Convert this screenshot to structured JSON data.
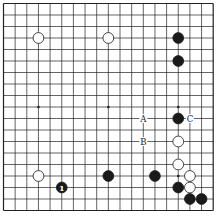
{
  "board": {
    "size": 19,
    "origin_x": 3.5,
    "origin_y": 3.5,
    "step_x": 11.65,
    "step_y": 11.5,
    "line_color": "#222222",
    "star_points": [
      [
        3,
        3
      ],
      [
        9,
        3
      ],
      [
        15,
        3
      ],
      [
        3,
        9
      ],
      [
        9,
        9
      ],
      [
        15,
        9
      ],
      [
        3,
        15
      ],
      [
        9,
        15
      ],
      [
        15,
        15
      ]
    ]
  },
  "stones": [
    {
      "color": "white",
      "col": 3,
      "row": 3
    },
    {
      "color": "white",
      "col": 9,
      "row": 3
    },
    {
      "color": "black",
      "col": 15,
      "row": 3
    },
    {
      "color": "black",
      "col": 15,
      "row": 5
    },
    {
      "color": "black",
      "col": 15,
      "row": 10
    },
    {
      "color": "white",
      "col": 15,
      "row": 12
    },
    {
      "color": "white",
      "col": 15,
      "row": 14
    },
    {
      "color": "white",
      "col": 3,
      "row": 15
    },
    {
      "color": "black",
      "col": 9,
      "row": 15
    },
    {
      "color": "black",
      "col": 13,
      "row": 15
    },
    {
      "color": "white",
      "col": 16,
      "row": 15
    },
    {
      "color": "black",
      "col": 5,
      "row": 16,
      "label": "1"
    },
    {
      "color": "black",
      "col": 15,
      "row": 16
    },
    {
      "color": "white",
      "col": 16,
      "row": 16
    },
    {
      "color": "black",
      "col": 16,
      "row": 17
    },
    {
      "color": "black",
      "col": 17,
      "row": 17
    }
  ],
  "markers": [
    {
      "label": "A",
      "col": 12,
      "row": 10
    },
    {
      "label": "B",
      "col": 12,
      "row": 12
    },
    {
      "label": "C",
      "col": 16,
      "row": 10
    }
  ]
}
